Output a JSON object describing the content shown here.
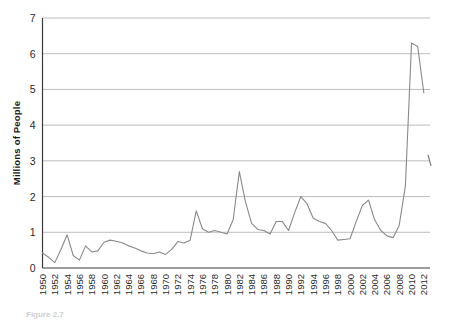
{
  "figure": {
    "caption_partial": "Figure 2.7",
    "line_color": "#8a8a8a",
    "grid_color": "#b5b5b5",
    "axis_color": "#3a3a3a",
    "background": "#ffffff"
  },
  "chart_data": {
    "type": "line",
    "title": "",
    "xlabel": "",
    "ylabel": "Millions of People",
    "ylim": [
      0,
      7
    ],
    "xlim": [
      1950,
      2013
    ],
    "grid": true,
    "legend": null,
    "yticks": [
      0,
      1,
      2,
      3,
      4,
      5,
      6,
      7
    ],
    "ytick_labels": [
      "0",
      "1",
      "2",
      "3",
      "4",
      "5",
      "6",
      "7"
    ],
    "xticks": [
      1950,
      1952,
      1954,
      1956,
      1958,
      1960,
      1962,
      1964,
      1966,
      1968,
      1970,
      1972,
      1974,
      1976,
      1978,
      1980,
      1982,
      1984,
      1986,
      1988,
      1990,
      1992,
      1994,
      1996,
      1998,
      2000,
      2002,
      2004,
      2006,
      2008,
      2010,
      2012
    ],
    "xtick_labels": [
      "1950",
      "1952",
      "1954",
      "1956",
      "1958",
      "1960",
      "1962",
      "1964",
      "1966",
      "1968",
      "1970",
      "1972",
      "1974",
      "1976",
      "1978",
      "1980",
      "1982",
      "1984",
      "1986",
      "1988",
      "1990",
      "1992",
      "1994",
      "1996",
      "1998",
      "2000",
      "2002",
      "2004",
      "2006",
      "2008",
      "2010",
      "2012"
    ],
    "x": [
      1950,
      1951,
      1952,
      1953,
      1954,
      1955,
      1956,
      1957,
      1958,
      1959,
      1960,
      1961,
      1962,
      1963,
      1964,
      1965,
      1966,
      1967,
      1968,
      1969,
      1970,
      1971,
      1972,
      1973,
      1974,
      1975,
      1976,
      1977,
      1978,
      1979,
      1980,
      1981,
      1982,
      1983,
      1984,
      1985,
      1986,
      1987,
      1988,
      1989,
      1990,
      1991,
      1992,
      1993,
      1994,
      1995,
      1996,
      1997,
      1998,
      1999,
      2000,
      2001,
      2002,
      2003,
      2004,
      2005,
      2006,
      2007,
      2008,
      2009,
      2010,
      2011,
      2012
    ],
    "values": [
      0.42,
      0.3,
      0.15,
      0.52,
      0.93,
      0.35,
      0.22,
      0.62,
      0.45,
      0.48,
      0.72,
      0.78,
      0.75,
      0.7,
      0.62,
      0.56,
      0.48,
      0.42,
      0.4,
      0.45,
      0.38,
      0.52,
      0.74,
      0.7,
      0.78,
      1.6,
      1.1,
      1.0,
      1.05,
      1.0,
      0.95,
      1.35,
      2.7,
      1.85,
      1.25,
      1.08,
      1.05,
      0.95,
      1.3,
      1.3,
      1.05,
      1.55,
      2.0,
      1.8,
      1.4,
      1.3,
      1.25,
      1.05,
      0.78,
      0.8,
      0.82,
      1.3,
      1.75,
      1.9,
      1.35,
      1.05,
      0.9,
      0.85,
      1.2,
      2.3,
      6.3,
      6.2,
      4.9
    ],
    "series_name": "People",
    "right_edge_marker": {
      "x": 2013,
      "y": 3.0
    }
  }
}
